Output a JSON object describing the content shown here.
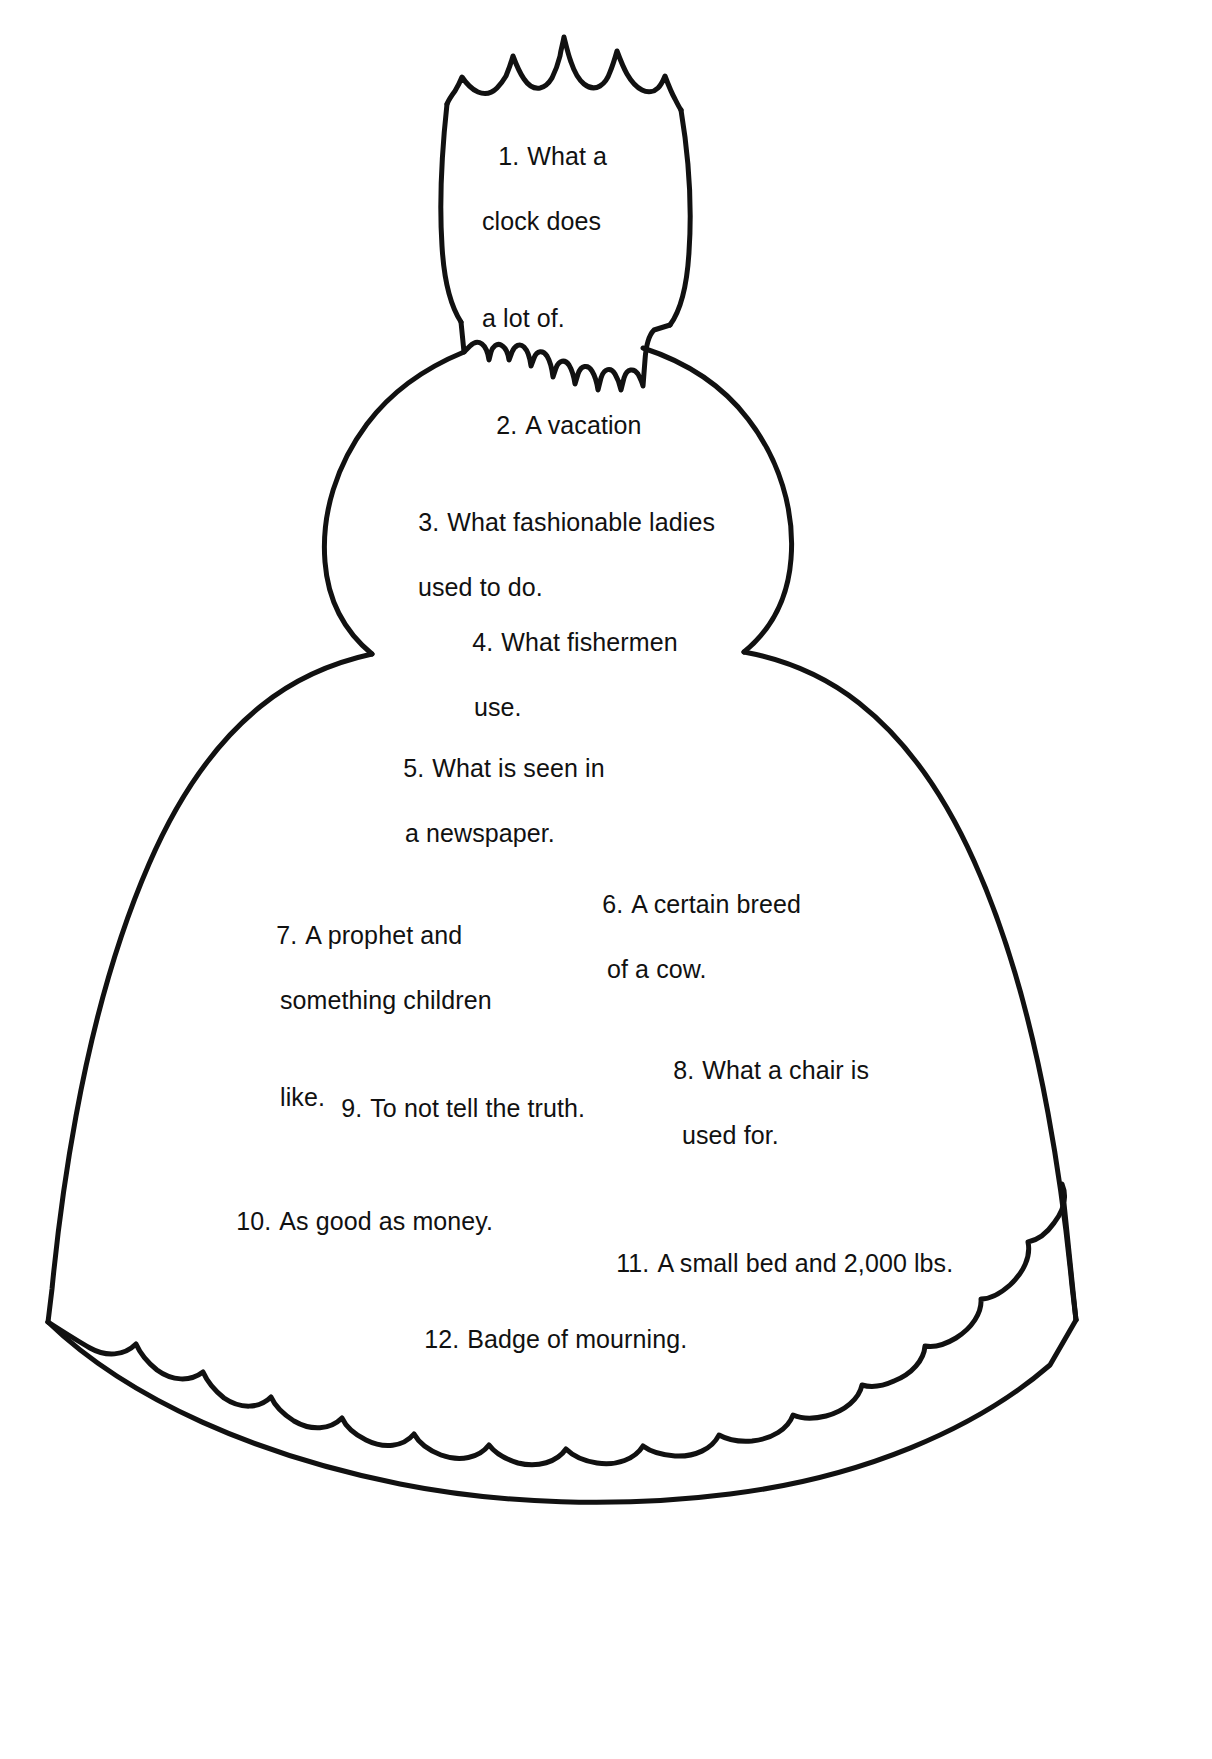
{
  "page": {
    "background_color": "#ffffff",
    "ink_color": "#111111",
    "width": 1212,
    "height": 1759,
    "figure_name": "bell-outline-with-crown-and-scalloped-hem"
  },
  "figure": {
    "stroke_color": "#111111",
    "fill_color": "#ffffff",
    "parts": [
      "crown-spikes",
      "crown-body",
      "jagged-collar",
      "round-head",
      "bell-skirt",
      "scalloped-hem"
    ]
  },
  "clues": [
    {
      "number": "1.",
      "lines": [
        "What a",
        "clock does",
        "a lot of."
      ]
    },
    {
      "number": "2.",
      "lines": [
        "A vacation"
      ]
    },
    {
      "number": "3.",
      "lines": [
        "What fashionable ladies",
        "used to do."
      ]
    },
    {
      "number": "4.",
      "lines": [
        "What fishermen",
        "use."
      ]
    },
    {
      "number": "5.",
      "lines": [
        "What is seen in",
        "a newspaper."
      ]
    },
    {
      "number": "6.",
      "lines": [
        "A certain breed",
        "of a cow."
      ]
    },
    {
      "number": "7.",
      "lines": [
        "A prophet and",
        "something children",
        "like."
      ]
    },
    {
      "number": "8.",
      "lines": [
        "What a chair is",
        "used for."
      ]
    },
    {
      "number": "9.",
      "lines": [
        "To not tell the truth."
      ]
    },
    {
      "number": "10.",
      "lines": [
        "As good as money."
      ]
    },
    {
      "number": "11.",
      "lines": [
        "A small bed and 2,000 lbs."
      ]
    },
    {
      "number": "12.",
      "lines": [
        "Badge of mourning."
      ]
    }
  ]
}
